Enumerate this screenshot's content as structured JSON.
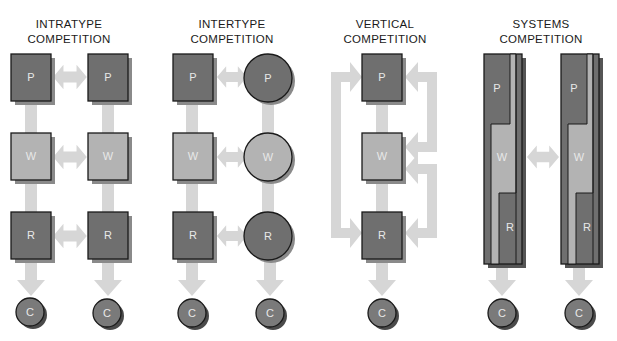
{
  "figure": {
    "panels": [
      {
        "id": "intratype",
        "title_line1": "INTRATYPE",
        "title_line2": "COMPETITION"
      },
      {
        "id": "intertype",
        "title_line1": "INTERTYPE",
        "title_line2": "COMPETITION"
      },
      {
        "id": "vertical",
        "title_line1": "VERTICAL",
        "title_line2": "COMPETITION"
      },
      {
        "id": "systems",
        "title_line1": "SYSTEMS",
        "title_line2": "COMPETITION"
      }
    ],
    "labels": {
      "producer": "P",
      "wholesaler": "W",
      "retailer": "R",
      "consumer": "C"
    },
    "colors": {
      "dark_node": "#6f6f6f",
      "light_node": "#b3b3b3",
      "shadow": "#8a8a8a",
      "arrow": "#d6d6d6",
      "outline": "#1a1a1a",
      "label": "#e8e8e8"
    }
  }
}
